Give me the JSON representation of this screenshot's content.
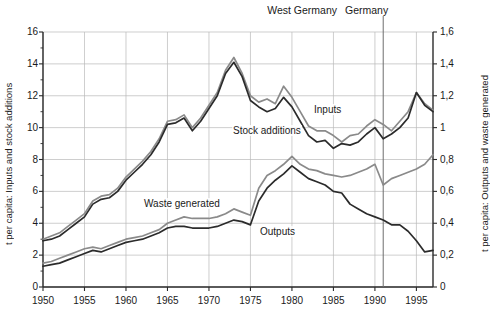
{
  "header": {
    "region_left": "West Germany",
    "region_right": "Germany"
  },
  "axes": {
    "left_title": "t per capita: Inputs and stock additions",
    "right_title": "t per capita: Outputs and waste generated",
    "y_left_ticks": [
      "16",
      "14",
      "12",
      "10",
      "8",
      "6",
      "4",
      "2",
      "0"
    ],
    "y_right_ticks": [
      "1,6",
      "1,4",
      "1,2",
      "1",
      "0,8",
      "0,6",
      "0,4",
      "0,2",
      "0"
    ],
    "x_ticks": [
      "1950",
      "1955",
      "1960",
      "1965",
      "1970",
      "1975",
      "1980",
      "1985",
      "1990",
      "1995"
    ]
  },
  "series_labels": {
    "inputs": "Inputs",
    "stock_additions": "Stock additions",
    "waste_generated": "Waste generated",
    "outputs": "Outputs"
  },
  "colors": {
    "inputs": "#8a8a8a",
    "stock_additions": "#2b2b2b",
    "waste_generated": "#8a8a8a",
    "outputs": "#2b2b2b",
    "grid": "#b9b9b9",
    "axis": "#2b2b2b",
    "divider": "#6e6e6e"
  },
  "chart_data": {
    "type": "line",
    "title": "",
    "xlabel": "",
    "ylabel": "t per capita: Inputs and stock additions",
    "y2label": "t per capita: Outputs and waste generated",
    "xlim": [
      1950,
      1997
    ],
    "ylim": [
      0,
      16
    ],
    "y2lim": [
      0,
      1.6
    ],
    "grid": true,
    "legend": "inline-annotations",
    "annotations": [
      {
        "text": "West Germany",
        "note": "period label, data before 1991 boundary"
      },
      {
        "text": "Germany",
        "note": "period label, data from 1991 boundary"
      },
      {
        "text": "divider",
        "x": 1991
      }
    ],
    "x": [
      1950,
      1951,
      1952,
      1953,
      1954,
      1955,
      1956,
      1957,
      1958,
      1959,
      1960,
      1961,
      1962,
      1963,
      1964,
      1965,
      1966,
      1967,
      1968,
      1969,
      1970,
      1971,
      1972,
      1973,
      1974,
      1975,
      1976,
      1977,
      1978,
      1979,
      1980,
      1981,
      1982,
      1983,
      1984,
      1985,
      1986,
      1987,
      1988,
      1989,
      1990,
      1991,
      1992,
      1993,
      1994,
      1995,
      1996,
      1997
    ],
    "series": [
      {
        "name": "Inputs",
        "axis": "left",
        "color": "#8a8a8a",
        "values": [
          3.0,
          3.2,
          3.4,
          3.8,
          4.2,
          4.6,
          5.4,
          5.7,
          5.8,
          6.2,
          6.9,
          7.4,
          7.9,
          8.5,
          9.3,
          10.4,
          10.5,
          10.8,
          10.0,
          10.6,
          11.4,
          12.2,
          13.6,
          14.4,
          13.4,
          12.0,
          11.6,
          11.8,
          11.5,
          12.6,
          11.9,
          11.0,
          10.1,
          9.8,
          9.8,
          9.5,
          9.1,
          9.5,
          9.6,
          10.1,
          10.5,
          10.2,
          9.8,
          10.4,
          11.0,
          12.2,
          11.5,
          11.1
        ]
      },
      {
        "name": "Stock additions",
        "axis": "left",
        "color": "#2b2b2b",
        "values": [
          2.9,
          3.0,
          3.2,
          3.6,
          4.0,
          4.4,
          5.2,
          5.5,
          5.6,
          6.0,
          6.7,
          7.2,
          7.7,
          8.3,
          9.1,
          10.2,
          10.3,
          10.6,
          9.8,
          10.4,
          11.2,
          12.0,
          13.4,
          14.1,
          13.2,
          11.7,
          11.3,
          11.0,
          11.2,
          11.9,
          11.3,
          10.4,
          9.5,
          9.1,
          9.2,
          8.7,
          9.0,
          8.9,
          9.1,
          9.6,
          10.0,
          9.3,
          9.6,
          10.0,
          10.6,
          12.2,
          11.4,
          11.0
        ]
      },
      {
        "name": "Waste generated",
        "axis": "right",
        "color": "#8a8a8a",
        "values": [
          0.15,
          0.16,
          0.18,
          0.2,
          0.22,
          0.24,
          0.25,
          0.24,
          0.26,
          0.28,
          0.3,
          0.31,
          0.32,
          0.34,
          0.36,
          0.4,
          0.42,
          0.44,
          0.43,
          0.43,
          0.43,
          0.44,
          0.46,
          0.49,
          0.47,
          0.45,
          0.62,
          0.7,
          0.73,
          0.77,
          0.82,
          0.77,
          0.74,
          0.73,
          0.71,
          0.7,
          0.69,
          0.7,
          0.72,
          0.74,
          0.77,
          0.64,
          0.68,
          0.7,
          0.72,
          0.74,
          0.77,
          0.83
        ]
      },
      {
        "name": "Outputs",
        "axis": "right",
        "color": "#2b2b2b",
        "values": [
          0.13,
          0.14,
          0.15,
          0.17,
          0.19,
          0.21,
          0.23,
          0.22,
          0.24,
          0.26,
          0.28,
          0.29,
          0.3,
          0.32,
          0.34,
          0.37,
          0.38,
          0.38,
          0.37,
          0.37,
          0.37,
          0.38,
          0.4,
          0.42,
          0.41,
          0.39,
          0.54,
          0.62,
          0.67,
          0.71,
          0.76,
          0.72,
          0.68,
          0.66,
          0.64,
          0.6,
          0.59,
          0.52,
          0.49,
          0.46,
          0.44,
          0.42,
          0.39,
          0.39,
          0.35,
          0.29,
          0.22,
          0.23
        ]
      }
    ]
  }
}
